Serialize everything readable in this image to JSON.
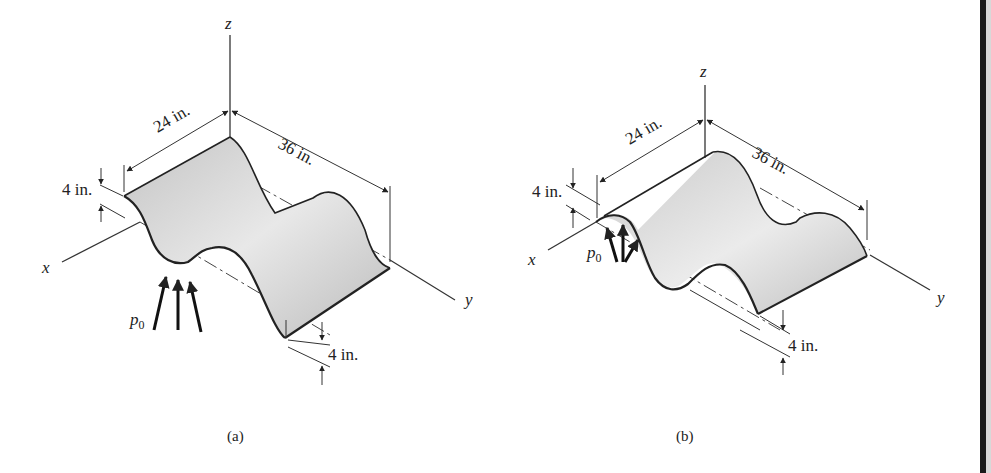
{
  "figure_a": {
    "caption": "(a)",
    "axes": {
      "x": "x",
      "y": "y",
      "z": "z"
    },
    "dimensions": {
      "width": "24 in.",
      "length": "36 in.",
      "amplitude_top": "4 in.",
      "amplitude_bottom": "4 in."
    },
    "load_label": "p",
    "load_subscript": "0"
  },
  "figure_b": {
    "caption": "(b)",
    "axes": {
      "x": "x",
      "y": "y",
      "z": "z"
    },
    "dimensions": {
      "width": "24 in.",
      "length": "36 in.",
      "amplitude_top": "4 in.",
      "amplitude_bottom": "4 in."
    },
    "load_label": "p",
    "load_subscript": "0"
  },
  "colors": {
    "surface_light": "#e4e4e4",
    "surface_dark": "#b9b9b9",
    "line": "#222222"
  }
}
